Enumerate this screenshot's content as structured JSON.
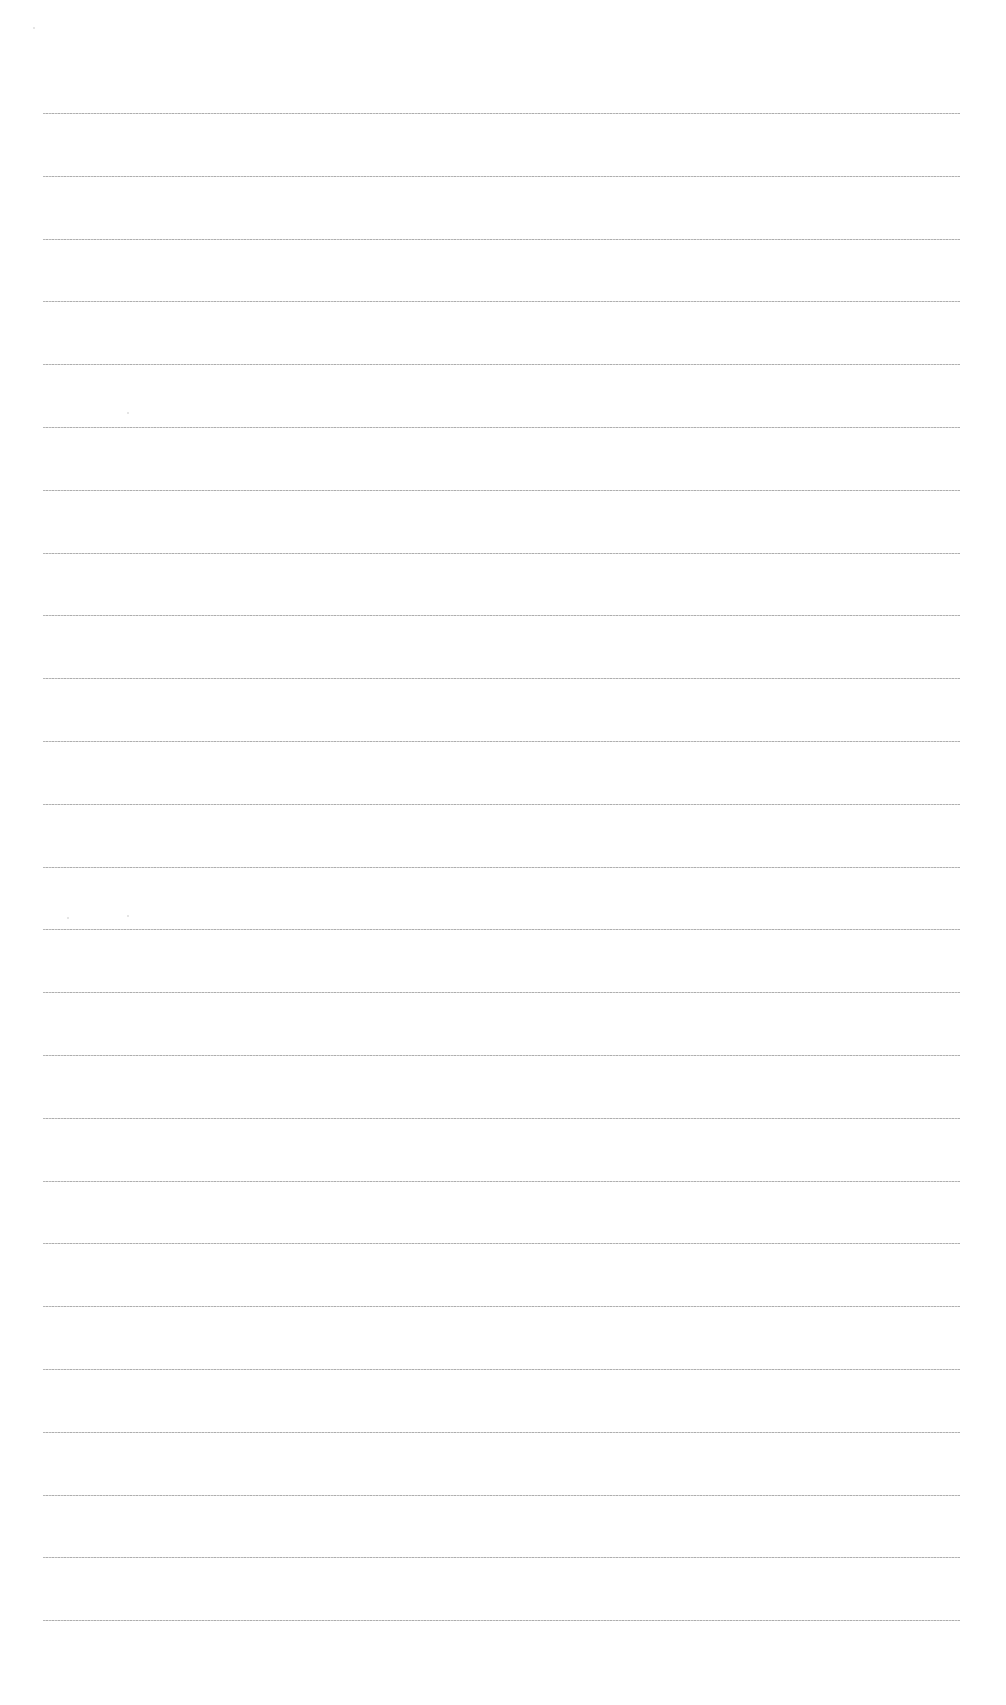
{
  "document": {
    "type": "ruled-paper",
    "content_text": "",
    "line_count": 25,
    "first_line_y": 113,
    "line_spacing": 62.8,
    "line_left": 43,
    "line_width": 917,
    "line_color": "#a9a9a9",
    "background_color": "#ffffff"
  }
}
